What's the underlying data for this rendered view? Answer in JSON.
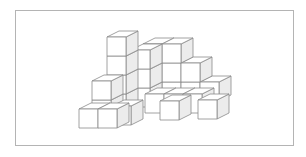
{
  "diagram": {
    "type": "isometric-cube-stack",
    "colors": {
      "stroke": "#8a8a8a",
      "front_face": "#ffffff",
      "top_face": "#ffffff",
      "side_face": "#ececec",
      "frame": "#b4b4b4",
      "background": "#ffffff"
    },
    "cube_size": 19,
    "depth_offset": [
      12,
      -6
    ],
    "cubes": [
      {
        "x": 162,
        "y": 82,
        "z": 0
      },
      {
        "x": 181,
        "y": 82,
        "z": 0
      },
      {
        "x": 200,
        "y": 82,
        "z": 0
      },
      {
        "x": 143,
        "y": 82,
        "z": 1
      },
      {
        "x": 162,
        "y": 82,
        "z": 1
      },
      {
        "x": 181,
        "y": 82,
        "z": 1
      },
      {
        "x": 143,
        "y": 82,
        "z": 2
      },
      {
        "x": 162,
        "y": 82,
        "z": 2
      },
      {
        "x": 131,
        "y": 88,
        "z": 0
      },
      {
        "x": 131,
        "y": 88,
        "z": 1
      },
      {
        "x": 131,
        "y": 88,
        "z": 2
      },
      {
        "x": 107,
        "y": 94,
        "z": 0
      },
      {
        "x": 107,
        "y": 94,
        "z": 1
      },
      {
        "x": 107,
        "y": 94,
        "z": 2
      },
      {
        "x": 107,
        "y": 94,
        "z": 3
      },
      {
        "x": 145,
        "y": 94,
        "z": 0
      },
      {
        "x": 164,
        "y": 94,
        "z": 0
      },
      {
        "x": 183,
        "y": 94,
        "z": 0
      },
      {
        "x": 198,
        "y": 100,
        "z": 0
      },
      {
        "x": 92,
        "y": 100,
        "z": 0
      },
      {
        "x": 92,
        "y": 100,
        "z": 1
      },
      {
        "x": 112,
        "y": 106,
        "z": 0
      },
      {
        "x": 79,
        "y": 109,
        "z": 0
      },
      {
        "x": 98,
        "y": 109,
        "z": 0
      },
      {
        "x": 160,
        "y": 101,
        "z": 0
      }
    ]
  }
}
